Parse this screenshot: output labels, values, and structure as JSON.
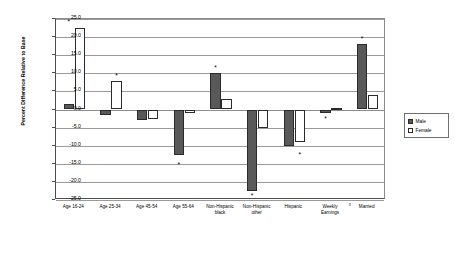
{
  "chart_data": {
    "type": "bar",
    "title": "",
    "xlabel": "",
    "ylabel": "Percent Difference\nRelative to Base",
    "ylim": [
      -25.0,
      25.0
    ],
    "ytick_values": [
      25.0,
      20.0,
      15.0,
      10.0,
      5.0,
      0.0,
      -5.0,
      -10.0,
      -15.0,
      -20.0,
      -25.0
    ],
    "ytick_labels": [
      "25.0",
      "20.0",
      "15.0",
      "10.0",
      "5.0",
      "0.0",
      "-5.0",
      "-10.0",
      "-15.0",
      "-20.0",
      "-25.0"
    ],
    "grid": true,
    "legend_position": "right",
    "categories": [
      "Age 16-24",
      "Age 25-34",
      "Age 45-54",
      "Age 55-64",
      "Non-Hispanic\nblack",
      "Non-Hispanic\nother",
      "Hispanic",
      "Weekly\nEarnings",
      "Married"
    ],
    "category_superscripts": {
      "Married": "3"
    },
    "series": [
      {
        "name": "Male",
        "color": "#595959",
        "values": [
          1.5,
          -1.5,
          -3.0,
          -12.5,
          10.0,
          -22.5,
          -10.0,
          -1.0,
          18.0
        ],
        "significant": [
          true,
          false,
          false,
          true,
          true,
          true,
          false,
          true,
          true
        ]
      },
      {
        "name": "Female",
        "color": "#ffffff",
        "values": [
          22.5,
          8.0,
          -2.5,
          -1.0,
          3.0,
          -5.0,
          -9.0,
          0.5,
          4.0
        ],
        "significant": [
          false,
          true,
          false,
          false,
          false,
          false,
          true,
          false,
          false
        ]
      }
    ],
    "significance_markers": [
      {
        "category": "Age 16-24",
        "series": "Male",
        "value": 24.0,
        "symbol": "*"
      },
      {
        "category": "Age 25-34",
        "series": "Female",
        "value": 9.3,
        "symbol": "*"
      },
      {
        "category": "Age 55-64",
        "series": "Male",
        "value": -15.3,
        "symbol": "*"
      },
      {
        "category": "Non-Hispanic black",
        "series": "Male",
        "value": 11.3,
        "symbol": "*"
      },
      {
        "category": "Non-Hispanic other",
        "series": "Male",
        "value": -24.0,
        "symbol": "*"
      },
      {
        "category": "Hispanic",
        "series": "Female",
        "value": -12.6,
        "symbol": "*"
      },
      {
        "category": "Weekly Earnings",
        "series": "Male",
        "value": -2.6,
        "symbol": "*"
      },
      {
        "category": "Married",
        "series": "Male",
        "value": 19.4,
        "symbol": "*"
      }
    ]
  },
  "legend": {
    "items": [
      {
        "label": "Male",
        "key": "male"
      },
      {
        "label": "Female",
        "key": "female"
      }
    ]
  }
}
